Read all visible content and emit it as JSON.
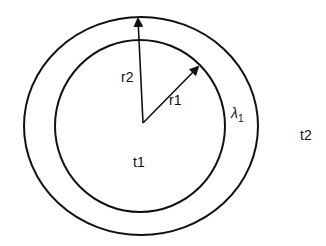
{
  "diagram": {
    "labels": {
      "inner_radius": "r1",
      "outer_radius": "r2",
      "inner_region": "t1",
      "outer_region": "t2",
      "layer_conductivity": "λ",
      "layer_conductivity_sub": "1"
    },
    "colors": {
      "stroke": "#111111",
      "background": "#ffffff"
    }
  }
}
